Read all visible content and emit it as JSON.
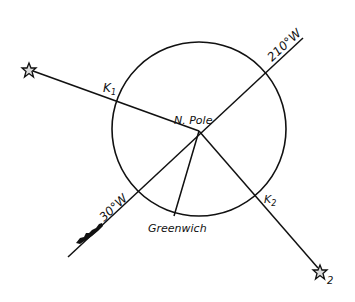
{
  "diagram": {
    "type": "celestial-navigation-polar-diagram",
    "labels": {
      "pole": "N. Pole",
      "meridian_210": "210°W",
      "meridian_30": "30°W",
      "greenwich": "Greenwich",
      "k1_main": "K",
      "k1_sub": "1",
      "k2_main": "K",
      "k2_sub": "2",
      "star2_sub": "2"
    },
    "icons": {
      "star1": "star-icon",
      "star2": "star-icon",
      "ship": "ship-icon"
    },
    "colors": {
      "ink": "#111111",
      "background": "#ffffff"
    }
  }
}
